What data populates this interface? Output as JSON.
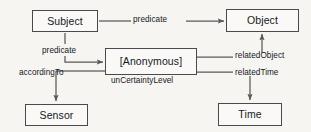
{
  "diagram": {
    "type": "rdf-reification-graph",
    "nodes": [
      {
        "id": "subject",
        "label": "Subject"
      },
      {
        "id": "object",
        "label": "Object"
      },
      {
        "id": "anonymous",
        "label": "[Anonymous]"
      },
      {
        "id": "sensor",
        "label": "Sensor"
      },
      {
        "id": "time",
        "label": "Time"
      }
    ],
    "edges": [
      {
        "id": "predicate-top",
        "label": "predicate",
        "from": "subject",
        "to": "object"
      },
      {
        "id": "predicate-left",
        "label": "predicate",
        "from": "subject",
        "to": "anonymous"
      },
      {
        "id": "according-to",
        "label": "accordingTo",
        "from": "anonymous",
        "to": "sensor"
      },
      {
        "id": "related-object",
        "label": "relatedObject",
        "from": "anonymous",
        "to": "object"
      },
      {
        "id": "related-time",
        "label": "relatedTime",
        "from": "anonymous",
        "to": "time"
      }
    ],
    "attributes": [
      {
        "id": "uncertainty",
        "label": "unCertaintyLevel",
        "on": "anonymous"
      }
    ],
    "colors": {
      "background": "#f6f5f2",
      "node_fill": "#faf9f7",
      "stroke": "#4a4a4a",
      "edge_stroke": "#58585a",
      "text": "#15181c"
    }
  }
}
